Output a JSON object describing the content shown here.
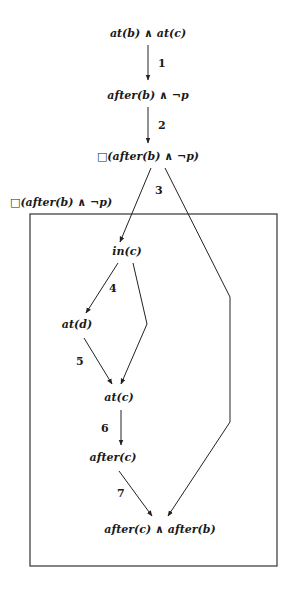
{
  "diagram": {
    "type": "state-transition-graph",
    "box_label": "□(after(b) ∧ ¬p)",
    "nodes": [
      {
        "id": "n1",
        "label": "at(b) ∧ at(c)"
      },
      {
        "id": "n2",
        "label": "after(b) ∧ ¬p"
      },
      {
        "id": "n3",
        "label": "□(after(b) ∧ ¬p)"
      },
      {
        "id": "n4",
        "label": "in(c)"
      },
      {
        "id": "n5",
        "label": "at(d)"
      },
      {
        "id": "n6",
        "label": "at(c)"
      },
      {
        "id": "n7",
        "label": "after(c)"
      },
      {
        "id": "n8",
        "label": "after(c) ∧ after(b)"
      }
    ],
    "edges": [
      {
        "from": "n1",
        "to": "n2",
        "label": "1"
      },
      {
        "from": "n2",
        "to": "n3",
        "label": "2"
      },
      {
        "from": "n3",
        "to": "n4",
        "label": "3"
      },
      {
        "from": "n3",
        "to": "n8",
        "label": ""
      },
      {
        "from": "n4",
        "to": "n5",
        "label": "4"
      },
      {
        "from": "n4",
        "to": "n6",
        "label": ""
      },
      {
        "from": "n5",
        "to": "n6",
        "label": "5"
      },
      {
        "from": "n6",
        "to": "n7",
        "label": "6"
      },
      {
        "from": "n7",
        "to": "n8",
        "label": "7"
      }
    ]
  }
}
